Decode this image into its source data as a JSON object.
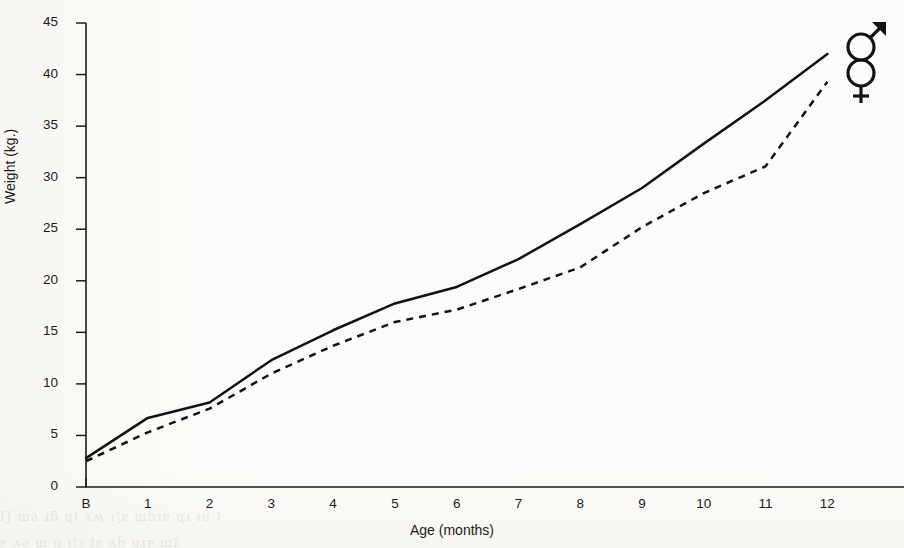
{
  "figure": {
    "background_color": "#fbfbf9",
    "ink_color": "#131313",
    "bleed_through_line1": "Ιʃ ɯǝ ɹƃ ɥʇ  ʌʍ ıןɐ ɯɓɹɐ ɥɹ  ıu  ʇ",
    "bleed_through_line2": "ɐ ʌǝ ɯ  ɥ ıןɹ  ʇɐ ʌɓ ɥɹɐ  ɯʇ"
  },
  "chart_data": {
    "type": "line",
    "title": "",
    "xlabel": "Age (months)",
    "ylabel": "Weight (kg.)",
    "xlim": [
      0,
      12.35
    ],
    "ylim": [
      0,
      45
    ],
    "grid": false,
    "legend_position": "plot-right-top",
    "categories": [
      "B",
      "1",
      "2",
      "3",
      "4",
      "5",
      "6",
      "7",
      "8",
      "9",
      "10",
      "11",
      "12"
    ],
    "x": [
      0,
      1,
      2,
      3,
      4,
      5,
      6,
      7,
      8,
      9,
      10,
      11,
      12
    ],
    "xtick_labels": [
      "B",
      "1",
      "2",
      "3",
      "4",
      "5",
      "6",
      "7",
      "8",
      "9",
      "10",
      "11",
      "12"
    ],
    "ytick_labels": [
      "0",
      "5",
      "10",
      "15",
      "20",
      "25",
      "30",
      "35",
      "40",
      "45"
    ],
    "ytick_values": [
      0,
      5,
      10,
      15,
      20,
      25,
      30,
      35,
      40,
      45
    ],
    "series": [
      {
        "name": "male",
        "symbol": "♂",
        "style": "solid",
        "values": [
          2.8,
          6.7,
          8.2,
          12.3,
          15.2,
          17.8,
          19.4,
          22.1,
          25.5,
          29.0,
          33.3,
          37.5,
          42.0
        ]
      },
      {
        "name": "female",
        "symbol": "♀",
        "style": "dashed",
        "values": [
          2.5,
          5.3,
          7.6,
          11.0,
          13.7,
          16.0,
          17.2,
          19.2,
          21.3,
          25.2,
          28.5,
          31.1,
          39.3
        ]
      }
    ],
    "annotations": [
      {
        "name": "male-symbol",
        "label": "♂",
        "x": 12.35,
        "y": 43.2
      },
      {
        "name": "female-symbol",
        "label": "♀",
        "x": 12.35,
        "y": 39.6
      }
    ]
  }
}
